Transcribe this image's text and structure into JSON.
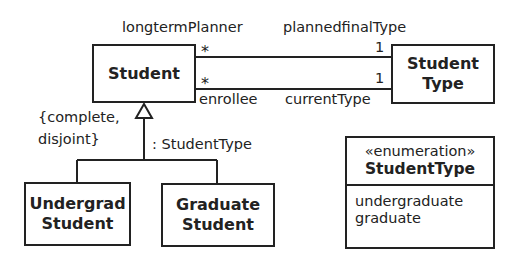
{
  "classes": {
    "student": {
      "name": "Student"
    },
    "student_type": {
      "line1": "Student",
      "line2": "Type"
    },
    "undergrad_student": {
      "line1": "Undergrad",
      "line2": "Student"
    },
    "graduate_student": {
      "line1": "Graduate",
      "line2": "Student"
    }
  },
  "associations": {
    "planned": {
      "source_role": "longtermPlanner",
      "source_multiplicity": "*",
      "target_role": "plannedfinalType",
      "target_multiplicity": "1"
    },
    "current": {
      "source_role": "enrollee",
      "source_multiplicity": "*",
      "target_role": "currentType",
      "target_multiplicity": "1"
    }
  },
  "generalization": {
    "constraint_line1": "{complete,",
    "constraint_line2": "disjoint}",
    "powertype": ": StudentType"
  },
  "enumeration": {
    "stereotype": "«enumeration»",
    "name": "StudentType",
    "literals": [
      "undergraduate",
      "graduate"
    ]
  }
}
